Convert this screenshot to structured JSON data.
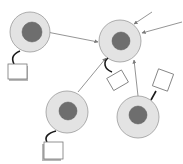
{
  "diagram": {
    "title": "",
    "nodes": [
      {
        "id": "A",
        "type": "cell",
        "has_attached_box": true
      },
      {
        "id": "B",
        "type": "cell",
        "has_attached_box": true
      },
      {
        "id": "C",
        "type": "cell",
        "has_attached_box": true
      },
      {
        "id": "D",
        "type": "cell",
        "has_attached_box": true
      }
    ],
    "edges": [
      {
        "from": "A",
        "to": "B",
        "arrow": true
      },
      {
        "from": "C",
        "to": "B",
        "arrow": true
      },
      {
        "from": "D",
        "to": "B",
        "arrow": true
      },
      {
        "from": "external-1",
        "to": "B",
        "arrow": true
      },
      {
        "from": "external-2",
        "to": "B",
        "arrow": true
      }
    ],
    "colors": {
      "cell_fill": "#e3e3e3",
      "nucleus_fill": "#6e6e6e",
      "link": "#7a7a7a",
      "tether": "#1a1a1a"
    }
  }
}
